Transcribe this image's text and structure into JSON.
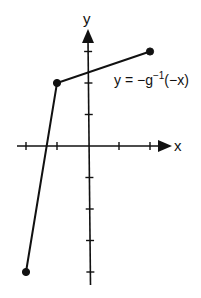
{
  "chart_data": {
    "type": "line",
    "title": "",
    "xlabel": "x",
    "ylabel": "y",
    "function_label": "y = −g",
    "function_label_sup": "−1",
    "function_label_tail": "(−x)",
    "x_ticks": [
      -2,
      -1,
      1,
      2
    ],
    "y_ticks": [
      -4,
      -3,
      -2,
      -1,
      1,
      2,
      3
    ],
    "tick_labels_shown": false,
    "grid": false,
    "xlim": [
      -2.3,
      2.7
    ],
    "ylim": [
      -4.5,
      3.7
    ],
    "series": [
      {
        "name": "y = -g^{-1}(-x)",
        "points": [
          {
            "x": -2,
            "y": -4,
            "endpoint": "closed"
          },
          {
            "x": -1,
            "y": 2,
            "endpoint": "closed"
          },
          {
            "x": 2,
            "y": 3,
            "endpoint": "closed"
          }
        ]
      }
    ]
  },
  "colors": {
    "ink": "#111111",
    "background": "#ffffff"
  }
}
